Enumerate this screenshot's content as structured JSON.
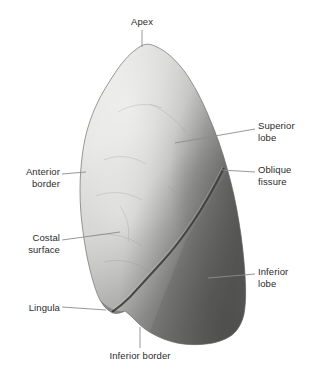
{
  "figure": {
    "background_color": "#ffffff",
    "label_color": "#2b2b2b",
    "leader_color": "#8c8c8c",
    "specimen": {
      "name": "lung-photograph",
      "tone_light": "#d8d8d6",
      "tone_mid": "#b4b4b2",
      "tone_dark": "#6e6e6c",
      "outline_color": "#5a5a58"
    }
  },
  "labels": [
    {
      "id": "apex",
      "name": "label-apex",
      "text": "Apex",
      "align": "center",
      "x": 120,
      "y": 16,
      "width": 44,
      "leader": "M142,30 L142,47"
    },
    {
      "id": "superior-lobe",
      "name": "label-superior-lobe",
      "text": "Superior\nlobe",
      "align": "left",
      "x": 258,
      "y": 120,
      "width": 54,
      "leader": "M255,129 L175,143"
    },
    {
      "id": "oblique-fissure",
      "name": "label-oblique-fissure",
      "text": "Oblique\nfissure",
      "align": "left",
      "x": 258,
      "y": 164,
      "width": 54,
      "leader": "M255,172 L222,170"
    },
    {
      "id": "inferior-lobe",
      "name": "label-inferior-lobe",
      "text": "Inferior\nlobe",
      "align": "left",
      "x": 258,
      "y": 266,
      "width": 54,
      "leader": "M255,274 L208,278"
    },
    {
      "id": "anterior-border",
      "name": "label-anterior-border",
      "text": "Anterior\nborder",
      "align": "right",
      "x": 6,
      "y": 166,
      "width": 54,
      "leader": "M62,174 L86,172"
    },
    {
      "id": "costal-surface",
      "name": "label-costal-surface",
      "text": "Costal\nsurface",
      "align": "right",
      "x": 4,
      "y": 232,
      "width": 56,
      "leader": "M62,240 L120,232"
    },
    {
      "id": "lingula",
      "name": "label-lingula",
      "text": "Lingula",
      "align": "right",
      "x": 6,
      "y": 302,
      "width": 54,
      "leader": "M62,307 L106,310"
    },
    {
      "id": "inferior-border",
      "name": "label-inferior-border",
      "text": "Inferior border",
      "align": "center",
      "x": 100,
      "y": 350,
      "width": 80,
      "leader": "M140,348 L140,327"
    }
  ]
}
